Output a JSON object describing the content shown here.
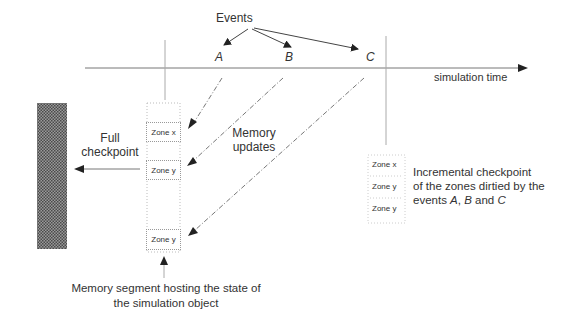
{
  "diagram": {
    "events_label": "Events",
    "event_names": [
      "A",
      "B",
      "C"
    ],
    "timeline_label": "simulation time",
    "full_checkpoint_label": [
      "Full",
      "checkpoint"
    ],
    "memory_updates_label": [
      "Memory",
      "updates"
    ],
    "memory_segment": {
      "zones": [
        "Zone x",
        "Zone y",
        "Zone y"
      ],
      "caption": [
        "Memory segment hosting the state of",
        "the simulation object"
      ]
    },
    "incremental_checkpoint": {
      "zones": [
        "Zone x",
        "Zone y",
        "Zone y"
      ],
      "caption_lines": [
        "Incremental checkpoint",
        "of the zones dirtied by the"
      ],
      "caption_line3": {
        "prefix": "events ",
        "a": "A",
        "sep1": ", ",
        "b": "B",
        "sep2": " and ",
        "c": "C"
      }
    },
    "colors": {
      "line": "#555555",
      "dash": "#777777",
      "hatch": "#6a6a6a",
      "text": "#333333"
    }
  }
}
